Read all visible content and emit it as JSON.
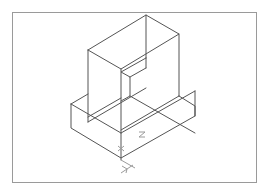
{
  "caption": "",
  "drawing": {
    "type": "isometric wireframe",
    "frame_color": "#9a9a9a",
    "edge_color": "#555555",
    "axis_labels": {
      "x": "X",
      "y": "Y",
      "z": "Z"
    }
  }
}
